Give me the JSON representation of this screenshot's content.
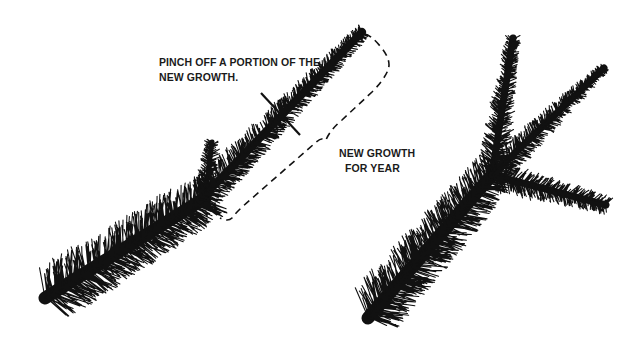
{
  "figure": {
    "background": "#ffffff",
    "ink_color": "#111111",
    "left_illustration": {
      "description": "conifer branch tip before pinching",
      "annotations": {
        "pinch_label": [
          "PINCH OFF A PORTION OF THE",
          "NEW GROWTH."
        ],
        "new_growth_label": [
          "NEW GROWTH",
          "FOR YEAR"
        ]
      }
    },
    "right_illustration": {
      "description": "branch after pinching showing multiple new shoots"
    }
  }
}
